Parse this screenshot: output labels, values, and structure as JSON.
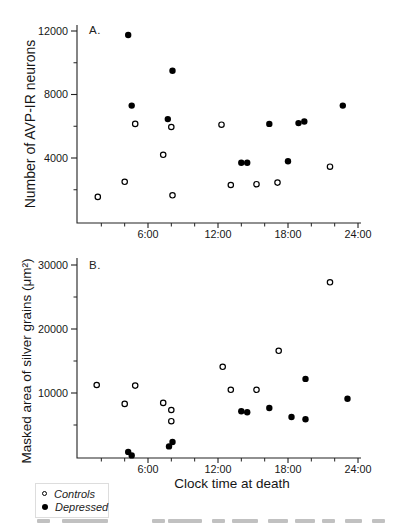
{
  "xlabel": "Clock time at death",
  "legend": {
    "items": [
      {
        "marker": "open-circle",
        "label": "Controls"
      },
      {
        "marker": "filled-circle",
        "label": "Depressed"
      }
    ]
  },
  "chart_data": [
    {
      "type": "scatter",
      "panel_label": "A.",
      "ylabel": "Number of AVP-IR neurons",
      "xlabel": "Clock time at death",
      "xlim": [
        0,
        24
      ],
      "ylim": [
        0,
        12500
      ],
      "grid": false,
      "yticks": [
        {
          "value": 4000,
          "label": "4000"
        },
        {
          "value": 8000,
          "label": "8000"
        },
        {
          "value": 12000,
          "label": "12000"
        }
      ],
      "yticks_minor": [
        2000,
        6000,
        10000
      ],
      "xticks": [
        {
          "value": 6,
          "label": "6:00"
        },
        {
          "value": 12,
          "label": "12:00"
        },
        {
          "value": 18,
          "label": "18:00"
        },
        {
          "value": 24,
          "label": "24:00"
        }
      ],
      "xticks_minor": [
        2,
        4,
        8,
        10,
        14,
        16,
        20,
        22
      ],
      "x_units": "decimal clock hours",
      "series": [
        {
          "name": "Controls",
          "marker": "open-circle",
          "points": [
            [
              1.7,
              1550
            ],
            [
              4.0,
              2500
            ],
            [
              4.9,
              6150
            ],
            [
              7.3,
              4200
            ],
            [
              8.0,
              5950
            ],
            [
              8.1,
              1650
            ],
            [
              12.3,
              6100
            ],
            [
              13.1,
              2300
            ],
            [
              15.3,
              2350
            ],
            [
              17.1,
              2450
            ],
            [
              21.6,
              3450
            ]
          ]
        },
        {
          "name": "Depressed",
          "marker": "filled-circle",
          "points": [
            [
              4.3,
              11750
            ],
            [
              4.6,
              7300
            ],
            [
              7.7,
              6450
            ],
            [
              8.1,
              9500
            ],
            [
              14.0,
              3700
            ],
            [
              14.5,
              3700
            ],
            [
              16.4,
              6150
            ],
            [
              18.0,
              3800
            ],
            [
              18.9,
              6200
            ],
            [
              19.4,
              6300
            ],
            [
              22.7,
              7300
            ]
          ]
        }
      ]
    },
    {
      "type": "scatter",
      "panel_label": "B.",
      "ylabel": "Masked area of silver grains (μm²)",
      "xlabel": "Clock time at death",
      "xlim": [
        0,
        24
      ],
      "ylim": [
        0,
        31000
      ],
      "grid": false,
      "yticks": [
        {
          "value": 10000,
          "label": "10000"
        },
        {
          "value": 20000,
          "label": "20000"
        },
        {
          "value": 30000,
          "label": "30000"
        }
      ],
      "yticks_minor": [
        5000,
        15000,
        25000
      ],
      "xticks": [
        {
          "value": 6,
          "label": "6:00"
        },
        {
          "value": 12,
          "label": "12:00"
        },
        {
          "value": 18,
          "label": "18:00"
        },
        {
          "value": 24,
          "label": "24:00"
        }
      ],
      "xticks_minor": [
        2,
        4,
        8,
        10,
        14,
        16,
        20,
        22
      ],
      "x_units": "decimal clock hours",
      "series": [
        {
          "name": "Controls",
          "marker": "open-circle",
          "points": [
            [
              1.6,
              11250
            ],
            [
              4.0,
              8300
            ],
            [
              4.9,
              11150
            ],
            [
              7.3,
              8450
            ],
            [
              8.0,
              7350
            ],
            [
              8.0,
              5600
            ],
            [
              12.4,
              14100
            ],
            [
              13.1,
              10500
            ],
            [
              15.3,
              10500
            ],
            [
              17.2,
              16600
            ],
            [
              21.6,
              27300
            ]
          ]
        },
        {
          "name": "Depressed",
          "marker": "filled-circle",
          "points": [
            [
              4.3,
              800
            ],
            [
              4.6,
              250
            ],
            [
              7.8,
              1650
            ],
            [
              8.1,
              2350
            ],
            [
              14.0,
              7150
            ],
            [
              14.5,
              7000
            ],
            [
              16.4,
              7650
            ],
            [
              18.3,
              6250
            ],
            [
              19.5,
              12200
            ],
            [
              19.5,
              5900
            ],
            [
              23.1,
              9100
            ]
          ]
        }
      ]
    }
  ]
}
